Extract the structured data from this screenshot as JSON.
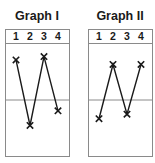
{
  "graphs": [
    {
      "title": "Graph I",
      "columns": [
        "1",
        "2",
        "3",
        "4"
      ],
      "values": [
        0.85,
        0.27,
        0.88,
        0.4
      ],
      "marker": "X"
    },
    {
      "title": "Graph II",
      "columns": [
        "1",
        "2",
        "3",
        "4"
      ],
      "values": [
        0.33,
        0.81,
        0.37,
        0.81
      ],
      "marker": "X"
    }
  ],
  "chart_data": [
    {
      "type": "line",
      "title": "Graph I",
      "categories": [
        "1",
        "2",
        "3",
        "4"
      ],
      "values": [
        0.85,
        0.27,
        0.88,
        0.4
      ],
      "xlabel": "",
      "ylabel": "",
      "ylim": [
        0,
        1
      ],
      "reference_line": 0.5,
      "grid": false
    },
    {
      "type": "line",
      "title": "Graph II",
      "categories": [
        "1",
        "2",
        "3",
        "4"
      ],
      "values": [
        0.33,
        0.81,
        0.37,
        0.81
      ],
      "xlabel": "",
      "ylabel": "",
      "ylim": [
        0,
        1
      ],
      "reference_line": 0.5,
      "grid": false
    }
  ],
  "colors": {
    "frame": "#8a8a8a",
    "line": "#1a1a1a",
    "text": "#1a1a1a"
  }
}
